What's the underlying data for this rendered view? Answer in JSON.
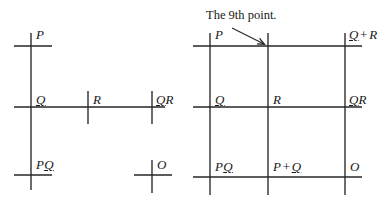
{
  "figure": {
    "background_color": "#ffffff",
    "ink_color": "#262626",
    "width": 381,
    "height": 203
  },
  "panels": [
    {
      "id": "left",
      "name": "incomplete-configuration",
      "kind": "partial-grid",
      "points": [
        {
          "id": "p",
          "label_parts": [
            {
              "text": "P",
              "underline": false,
              "italic": true
            }
          ],
          "plain": "P",
          "x": 31,
          "y": 46,
          "marker": "cross"
        },
        {
          "id": "q",
          "label_parts": [
            {
              "text": "Q",
              "underline": true,
              "italic": true
            }
          ],
          "plain": "Q",
          "x": 31,
          "y": 107,
          "marker": "cross"
        },
        {
          "id": "r",
          "label_parts": [
            {
              "text": "R",
              "underline": false,
              "italic": true
            }
          ],
          "plain": "R",
          "x": 88,
          "y": 107,
          "marker": "tick"
        },
        {
          "id": "qr",
          "label_parts": [
            {
              "text": "Q",
              "underline": true,
              "italic": true
            },
            {
              "text": "R",
              "underline": false,
              "italic": true
            }
          ],
          "plain": "QR",
          "x": 152,
          "y": 107,
          "marker": "tick"
        },
        {
          "id": "pq",
          "label_parts": [
            {
              "text": "P",
              "underline": false,
              "italic": true
            },
            {
              "text": "Q",
              "underline": true,
              "italic": true
            }
          ],
          "plain": "PQ",
          "x": 31,
          "y": 175,
          "marker": "cross"
        },
        {
          "id": "o",
          "label_parts": [
            {
              "text": "O",
              "underline": false,
              "italic": true
            }
          ],
          "plain": "O",
          "x": 152,
          "y": 175,
          "marker": "cross"
        }
      ]
    },
    {
      "id": "right",
      "name": "complete-configuration",
      "kind": "full-grid",
      "annotation": {
        "text": "The 9th point.",
        "arrow_from": [
          232,
          28
        ],
        "arrow_to": [
          266,
          45
        ]
      },
      "points": [
        {
          "id": "p",
          "label_parts": [
            {
              "text": "P",
              "underline": false,
              "italic": true
            }
          ],
          "plain": "P",
          "x": 210,
          "y": 46
        },
        {
          "id": "p9",
          "label_parts": [],
          "plain": "",
          "x": 268,
          "y": 46
        },
        {
          "id": "qplr",
          "label_parts": [
            {
              "text": "Q",
              "underline": true,
              "italic": true
            },
            {
              "text": "+",
              "underline": false,
              "italic": false,
              "operator": true
            },
            {
              "text": "R",
              "underline": false,
              "italic": true
            }
          ],
          "plain": "Q + R",
          "x": 345,
          "y": 46
        },
        {
          "id": "q",
          "label_parts": [
            {
              "text": "Q",
              "underline": true,
              "italic": true
            }
          ],
          "plain": "Q",
          "x": 210,
          "y": 107
        },
        {
          "id": "r",
          "label_parts": [
            {
              "text": "R",
              "underline": false,
              "italic": true
            }
          ],
          "plain": "R",
          "x": 268,
          "y": 107
        },
        {
          "id": "qr",
          "label_parts": [
            {
              "text": "Q",
              "underline": true,
              "italic": true
            },
            {
              "text": "R",
              "underline": false,
              "italic": true
            }
          ],
          "plain": "QR",
          "x": 345,
          "y": 107
        },
        {
          "id": "pq",
          "label_parts": [
            {
              "text": "P",
              "underline": false,
              "italic": true
            },
            {
              "text": "Q",
              "underline": true,
              "italic": true
            }
          ],
          "plain": "PQ",
          "x": 210,
          "y": 177
        },
        {
          "id": "pplq",
          "label_parts": [
            {
              "text": "P",
              "underline": false,
              "italic": true
            },
            {
              "text": "+",
              "underline": false,
              "italic": false,
              "operator": true
            },
            {
              "text": "Q",
              "underline": true,
              "italic": true
            }
          ],
          "plain": "P + Q",
          "x": 268,
          "y": 177
        },
        {
          "id": "o",
          "label_parts": [
            {
              "text": "O",
              "underline": false,
              "italic": true
            }
          ],
          "plain": "O",
          "x": 345,
          "y": 177
        }
      ]
    }
  ],
  "labels": {
    "left_p": "P",
    "left_q": "Q",
    "left_r": "R",
    "left_qr": "QR",
    "left_pq": "PQ",
    "left_o": "O",
    "right_p": "P",
    "right_q_plus_r": "Q + R",
    "right_q": "Q",
    "right_r": "R",
    "right_qr": "QR",
    "right_pq": "PQ",
    "right_p_plus_q": "P + Q",
    "right_o": "O",
    "annotation": "The 9th point."
  }
}
